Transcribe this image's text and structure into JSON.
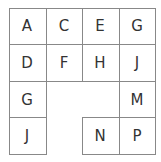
{
  "grid": {
    "rows": 4,
    "cols": 4,
    "cells": [
      {
        "row": 0,
        "col": 0,
        "letter": "A"
      },
      {
        "row": 0,
        "col": 1,
        "letter": "C"
      },
      {
        "row": 0,
        "col": 2,
        "letter": "E"
      },
      {
        "row": 0,
        "col": 3,
        "letter": "G"
      },
      {
        "row": 1,
        "col": 0,
        "letter": "D"
      },
      {
        "row": 1,
        "col": 1,
        "letter": "F"
      },
      {
        "row": 1,
        "col": 2,
        "letter": "H"
      },
      {
        "row": 1,
        "col": 3,
        "letter": "J"
      },
      {
        "row": 2,
        "col": 0,
        "letter": "G"
      },
      {
        "row": 2,
        "col": 3,
        "letter": "M"
      },
      {
        "row": 3,
        "col": 0,
        "letter": "J"
      },
      {
        "row": 3,
        "col": 2,
        "letter": "N"
      },
      {
        "row": 3,
        "col": 3,
        "letter": "P"
      }
    ]
  },
  "colors": {
    "line": "#888888",
    "text": "#333333",
    "background": "#ffffff"
  }
}
